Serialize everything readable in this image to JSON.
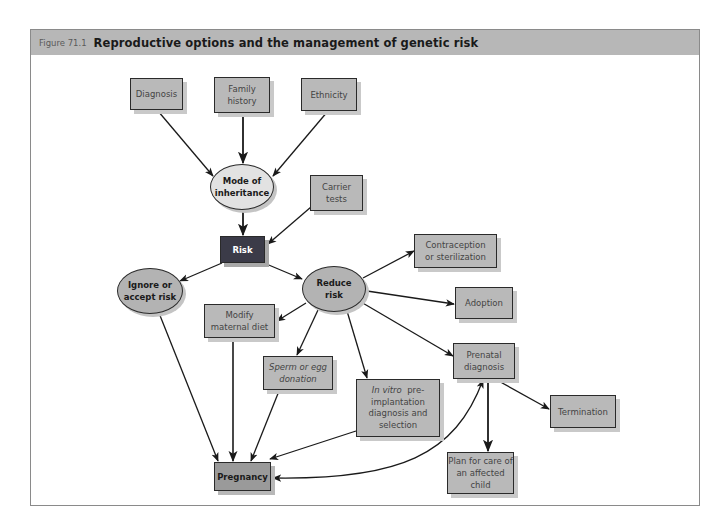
{
  "figure": {
    "number": "Figure 71.1",
    "title": "Reproductive options and the management of genetic risk"
  },
  "nodes": {
    "diagnosis": {
      "label": "Diagnosis",
      "shape": "box"
    },
    "family_history": {
      "label_line1": "Family",
      "label_line2": "history",
      "shape": "box"
    },
    "ethnicity": {
      "label": "Ethnicity",
      "shape": "box"
    },
    "mode_of_inheritance": {
      "label_line1": "Mode of",
      "label_line2": "inheritance",
      "shape": "ellipse"
    },
    "carrier_tests": {
      "label_line1": "Carrier",
      "label_line2": "tests",
      "shape": "box"
    },
    "risk": {
      "label": "Risk",
      "shape": "box-dark"
    },
    "ignore_or_accept_risk": {
      "label_line1": "Ignore or",
      "label_line2": "accept risk",
      "shape": "ellipse"
    },
    "reduce_risk": {
      "label_line1": "Reduce",
      "label_line2": "risk",
      "shape": "ellipse"
    },
    "contraception": {
      "label_line1": "Contraception",
      "label_line2": "or sterilization",
      "shape": "box"
    },
    "adoption": {
      "label": "Adoption",
      "shape": "box"
    },
    "modify_maternal_diet": {
      "label_line1": "Modify",
      "label_line2": "maternal diet",
      "shape": "box"
    },
    "sperm_or_egg_donation": {
      "label_line1": "Sperm or egg",
      "label_line2": "donation",
      "shape": "box"
    },
    "in_vitro": {
      "label_italic": "In vitro",
      "label_line1_rest": "pre-",
      "label_line2": "implantation",
      "label_line3": "diagnosis and",
      "label_line4": "selection",
      "shape": "box"
    },
    "prenatal_diagnosis": {
      "label_line1": "Prenatal",
      "label_line2": "diagnosis",
      "shape": "box"
    },
    "termination": {
      "label": "Termination",
      "shape": "box"
    },
    "plan_for_care": {
      "label_line1": "Plan for care of",
      "label_line2": "an affected child",
      "shape": "box"
    },
    "pregnancy": {
      "label": "Pregnancy",
      "shape": "box-emphasis"
    }
  },
  "edges": [
    {
      "from": "Diagnosis",
      "to": "Mode of inheritance"
    },
    {
      "from": "Family history",
      "to": "Mode of inheritance"
    },
    {
      "from": "Ethnicity",
      "to": "Mode of inheritance"
    },
    {
      "from": "Mode of inheritance",
      "to": "Risk"
    },
    {
      "from": "Carrier tests",
      "to": "Risk"
    },
    {
      "from": "Risk",
      "to": "Ignore or accept risk"
    },
    {
      "from": "Risk",
      "to": "Reduce risk"
    },
    {
      "from": "Reduce risk",
      "to": "Contraception or sterilization"
    },
    {
      "from": "Reduce risk",
      "to": "Adoption"
    },
    {
      "from": "Reduce risk",
      "to": "Modify maternal diet"
    },
    {
      "from": "Reduce risk",
      "to": "Sperm or egg donation"
    },
    {
      "from": "Reduce risk",
      "to": "In vitro pre-implantation diagnosis and selection"
    },
    {
      "from": "Reduce risk",
      "to": "Prenatal diagnosis"
    },
    {
      "from": "Prenatal diagnosis",
      "to": "Termination"
    },
    {
      "from": "Prenatal diagnosis",
      "to": "Plan for care of an affected child"
    },
    {
      "from": "Ignore or accept risk",
      "to": "Pregnancy"
    },
    {
      "from": "Modify maternal diet",
      "to": "Pregnancy"
    },
    {
      "from": "Sperm or egg donation",
      "to": "Pregnancy"
    },
    {
      "from": "In vitro pre-implantation diagnosis and selection",
      "to": "Pregnancy"
    },
    {
      "from": "Prenatal diagnosis",
      "to": "Pregnancy",
      "bidirectional": true,
      "curved": true
    }
  ],
  "colors": {
    "header_bg": "#b7b7b7",
    "box_fill": "#b9b9b9",
    "risk_fill": "#3b3b48",
    "pregnancy_fill": "#9a9a9a",
    "ellipse_light": "#e2e2e2",
    "ellipse_mid": "#b3b3b3",
    "line": "#1a1a1a"
  }
}
